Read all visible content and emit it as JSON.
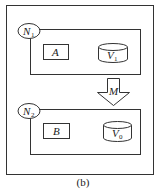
{
  "diagram": {
    "caption": "(b)",
    "nodes": [
      {
        "id": "N1",
        "label": "N",
        "subscript": "1",
        "contains": [
          {
            "type": "process",
            "label": "A"
          },
          {
            "type": "database",
            "label": "V",
            "subscript": "1"
          }
        ]
      },
      {
        "id": "N2",
        "label": "N",
        "subscript": "2",
        "contains": [
          {
            "type": "process",
            "label": "B"
          },
          {
            "type": "database",
            "label": "V",
            "subscript": "0"
          }
        ]
      }
    ],
    "arrow": {
      "label": "M",
      "from": "N1",
      "to": "N2"
    }
  }
}
